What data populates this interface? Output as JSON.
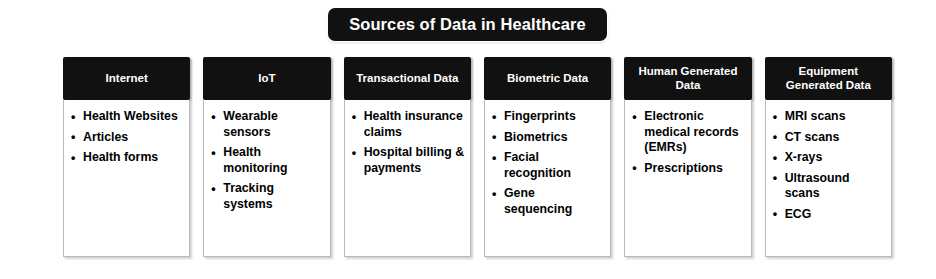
{
  "title": {
    "text": "Sources of Data in Healthcare",
    "background": "#111111",
    "text_color": "#ffffff"
  },
  "columns": [
    {
      "header": "Internet",
      "items": [
        "Health Websites",
        "Articles",
        "Health forms"
      ]
    },
    {
      "header": "IoT",
      "items": [
        "Wearable sensors",
        "Health monitoring",
        "Tracking systems"
      ]
    },
    {
      "header": "Transactional Data",
      "items": [
        "Health insurance claims",
        "Hospital billing & payments"
      ]
    },
    {
      "header": "Biometric Data",
      "items": [
        "Fingerprints",
        "Biometrics",
        "Facial recognition",
        "Gene sequencing"
      ]
    },
    {
      "header": "Human Generated Data",
      "items": [
        "Electronic medical records (EMRs)",
        "Prescriptions"
      ]
    },
    {
      "header": "Equipment Generated Data",
      "items": [
        "MRI scans",
        "CT scans",
        "X-rays",
        "Ultrasound scans",
        "ECG"
      ]
    }
  ]
}
